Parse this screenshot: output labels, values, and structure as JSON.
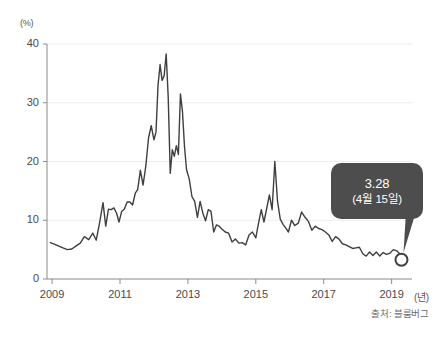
{
  "chart_data": {
    "type": "line",
    "title": "",
    "subtitle": "",
    "xlabel": "(년)",
    "ylabel": "(%)",
    "xlim": [
      2008.85,
      2019.6
    ],
    "ylim": [
      0,
      40
    ],
    "grid": true,
    "legend": null,
    "series": [
      {
        "name": "",
        "color": "#3f3f3f",
        "x": [
          2008.95,
          2009.08,
          2009.2,
          2009.32,
          2009.45,
          2009.58,
          2009.7,
          2009.83,
          2009.95,
          2010.08,
          2010.2,
          2010.3,
          2010.4,
          2010.5,
          2010.58,
          2010.66,
          2010.74,
          2010.82,
          2010.9,
          2010.97,
          2011.05,
          2011.13,
          2011.21,
          2011.29,
          2011.37,
          2011.45,
          2011.52,
          2011.6,
          2011.68,
          2011.76,
          2011.84,
          2011.92,
          2012.0,
          2012.06,
          2012.12,
          2012.18,
          2012.24,
          2012.3,
          2012.36,
          2012.42,
          2012.48,
          2012.54,
          2012.6,
          2012.66,
          2012.72,
          2012.78,
          2012.84,
          2012.9,
          2012.96,
          2013.04,
          2013.12,
          2013.2,
          2013.28,
          2013.36,
          2013.44,
          2013.52,
          2013.6,
          2013.68,
          2013.76,
          2013.84,
          2013.92,
          2014.0,
          2014.1,
          2014.2,
          2014.3,
          2014.4,
          2014.5,
          2014.6,
          2014.7,
          2014.8,
          2014.9,
          2015.0,
          2015.08,
          2015.16,
          2015.24,
          2015.32,
          2015.4,
          2015.48,
          2015.56,
          2015.64,
          2015.72,
          2015.8,
          2015.88,
          2015.96,
          2016.05,
          2016.15,
          2016.25,
          2016.35,
          2016.45,
          2016.55,
          2016.65,
          2016.75,
          2016.85,
          2016.95,
          2017.05,
          2017.15,
          2017.25,
          2017.35,
          2017.45,
          2017.55,
          2017.65,
          2017.75,
          2017.85,
          2017.95,
          2018.05,
          2018.15,
          2018.25,
          2018.35,
          2018.45,
          2018.55,
          2018.65,
          2018.75,
          2018.85,
          2018.95,
          2019.05,
          2019.15,
          2019.25,
          2019.29
        ],
        "y": [
          6.2,
          5.9,
          5.6,
          5.3,
          5.0,
          5.1,
          5.6,
          6.1,
          7.2,
          6.7,
          7.8,
          6.6,
          9.6,
          13.0,
          9.0,
          11.9,
          11.8,
          12.1,
          11.2,
          9.7,
          11.5,
          11.9,
          13.1,
          13.1,
          12.6,
          14.6,
          15.2,
          18.5,
          16.0,
          19.2,
          24.0,
          26.1,
          23.7,
          25.0,
          33.0,
          36.5,
          33.8,
          34.6,
          38.3,
          31.0,
          18.0,
          22.0,
          20.9,
          22.7,
          21.2,
          31.5,
          28.5,
          22.5,
          18.6,
          17.0,
          14.0,
          13.2,
          10.5,
          13.2,
          11.2,
          9.9,
          11.8,
          11.5,
          8.0,
          9.2,
          9.0,
          8.5,
          8.0,
          7.8,
          6.3,
          6.8,
          6.1,
          6.2,
          5.8,
          7.5,
          8.0,
          7.0,
          9.5,
          11.8,
          9.7,
          12.0,
          14.3,
          11.8,
          20.0,
          13.2,
          10.2,
          9.3,
          8.7,
          8.0,
          10.0,
          9.1,
          9.5,
          11.4,
          10.5,
          9.8,
          8.3,
          9.0,
          8.6,
          8.4,
          8.0,
          7.5,
          6.4,
          7.2,
          6.8,
          6.0,
          5.8,
          5.5,
          5.2,
          5.3,
          5.4,
          4.3,
          3.9,
          4.6,
          4.0,
          4.6,
          3.9,
          4.5,
          4.2,
          4.4,
          5.0,
          4.8,
          4.2,
          3.28
        ]
      }
    ],
    "y_ticks": [
      0,
      10,
      20,
      30,
      40
    ],
    "y_tick_labels": [
      "0",
      "10",
      "20",
      "30",
      "40"
    ],
    "x_ticks": [
      2009,
      2011,
      2013,
      2015,
      2017,
      2019
    ],
    "x_tick_labels": [
      "2009",
      "2011",
      "2013",
      "2015",
      "2017",
      "2019"
    ],
    "annotations": [
      {
        "label": "callout",
        "value": "3.28",
        "date": "(4월 15일)",
        "point_x": 2019.29,
        "point_y": 3.28,
        "background": "#4d4d4d",
        "text_color": "#ffffff"
      }
    ],
    "source": "출처: 블룸버그",
    "axis_color": "#8a8a8a",
    "grid_color": "#ededed",
    "line_color": "#3f3f3f"
  },
  "axes": {
    "y_unit": "(%)",
    "x_unit": "(년)"
  },
  "source": {
    "text": "출처: 블룸버그"
  },
  "tooltip": {
    "value": "3.28",
    "date": "(4월 15일)"
  }
}
